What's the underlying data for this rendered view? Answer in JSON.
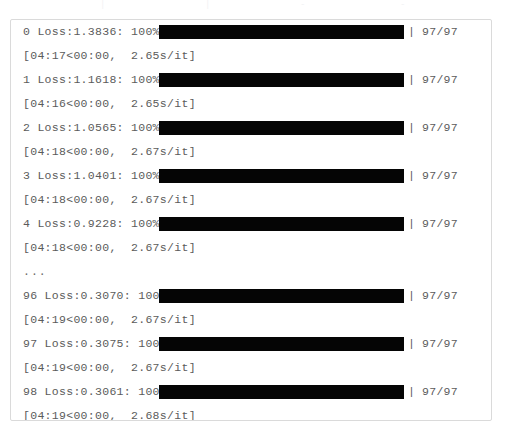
{
  "panel": {
    "border_color": "#dadada",
    "background_color": "#ffffff",
    "text_color": "#5b5b5b",
    "bar_color": "#050505"
  },
  "top_artifacts": [
    {
      "text": "|",
      "left": 100
    },
    {
      "text": "|",
      "left": 205
    },
    {
      "text": "-",
      "left": 300
    },
    {
      "text": "-",
      "left": 400
    }
  ],
  "log": {
    "rows": [
      {
        "kind": "progress",
        "epoch": "0",
        "loss_label": "Loss:",
        "loss": "1.3836",
        "percent": "100%",
        "prefix": "0 Loss:1.3836: 100%|",
        "bar_left": 148,
        "bar_right": 393,
        "close_bar": "|",
        "count": "97/97"
      },
      {
        "kind": "timing",
        "text": "[04:17<00:00,  2.65s/it]",
        "elapsed": "04:17",
        "remaining": "00:00",
        "rate": "2.65s/it"
      },
      {
        "kind": "progress",
        "epoch": "1",
        "loss_label": "Loss:",
        "loss": "1.1618",
        "percent": "100%",
        "prefix": "1 Loss:1.1618: 100%|",
        "bar_left": 148,
        "bar_right": 393,
        "close_bar": "|",
        "count": "97/97"
      },
      {
        "kind": "timing",
        "text": "[04:16<00:00,  2.65s/it]",
        "elapsed": "04:16",
        "remaining": "00:00",
        "rate": "2.65s/it"
      },
      {
        "kind": "progress",
        "epoch": "2",
        "loss_label": "Loss:",
        "loss": "1.0565",
        "percent": "100%",
        "prefix": "2 Loss:1.0565: 100%|",
        "bar_left": 148,
        "bar_right": 393,
        "close_bar": "|",
        "count": "97/97"
      },
      {
        "kind": "timing",
        "text": "[04:18<00:00,  2.67s/it]",
        "elapsed": "04:18",
        "remaining": "00:00",
        "rate": "2.67s/it"
      },
      {
        "kind": "progress",
        "epoch": "3",
        "loss_label": "Loss:",
        "loss": "1.0401",
        "percent": "100%",
        "prefix": "3 Loss:1.0401: 100%|",
        "bar_left": 148,
        "bar_right": 393,
        "close_bar": "|",
        "count": "97/97"
      },
      {
        "kind": "timing",
        "text": "[04:18<00:00,  2.67s/it]",
        "elapsed": "04:18",
        "remaining": "00:00",
        "rate": "2.67s/it"
      },
      {
        "kind": "progress",
        "epoch": "4",
        "loss_label": "Loss:",
        "loss": "0.9228",
        "percent": "100%",
        "prefix": "4 Loss:0.9228: 100%|",
        "bar_left": 148,
        "bar_right": 393,
        "close_bar": "|",
        "count": "97/97"
      },
      {
        "kind": "timing",
        "text": "[04:18<00:00,  2.67s/it]",
        "elapsed": "04:18",
        "remaining": "00:00",
        "rate": "2.67s/it"
      },
      {
        "kind": "ellipsis",
        "text": "..."
      },
      {
        "kind": "progress",
        "epoch": "96",
        "loss_label": "Loss:",
        "loss": "0.3070",
        "percent": "100%",
        "prefix": "96 Loss:0.3070: 100%|",
        "bar_left": 148,
        "bar_right": 393,
        "close_bar": "|",
        "count": "97/97"
      },
      {
        "kind": "timing",
        "text": "[04:19<00:00,  2.67s/it]",
        "elapsed": "04:19",
        "remaining": "00:00",
        "rate": "2.67s/it"
      },
      {
        "kind": "progress",
        "epoch": "97",
        "loss_label": "Loss:",
        "loss": "0.3075",
        "percent": "100%",
        "prefix": "97 Loss:0.3075: 100%|",
        "bar_left": 148,
        "bar_right": 393,
        "close_bar": "|",
        "count": "97/97"
      },
      {
        "kind": "timing",
        "text": "[04:19<00:00,  2.67s/it]",
        "elapsed": "04:19",
        "remaining": "00:00",
        "rate": "2.67s/it"
      },
      {
        "kind": "progress",
        "epoch": "98",
        "loss_label": "Loss:",
        "loss": "0.3061",
        "percent": "100%",
        "prefix": "98 Loss:0.3061: 100%|",
        "bar_left": 148,
        "bar_right": 393,
        "close_bar": "|",
        "count": "97/97"
      },
      {
        "kind": "timing",
        "text": "[04:19<00:00,  2.68s/it]",
        "elapsed": "04:19",
        "remaining": "00:00",
        "rate": "2.68s/it"
      },
      {
        "kind": "progress",
        "epoch": "99",
        "loss_label": "Loss:",
        "loss": "0.3014",
        "percent": "100%",
        "prefix": "99 Loss:0.3014: 100%|",
        "bar_left": 148,
        "bar_right": 393,
        "close_bar": "|",
        "count": "97/97"
      },
      {
        "kind": "timing",
        "text": "[04:19<00:00,  2.67s/it]",
        "elapsed": "04:19",
        "remaining": "00:00",
        "rate": "2.67s/it"
      },
      {
        "kind": "progress",
        "epoch": "100",
        "loss_label": "Loss:",
        "loss": "0.3010",
        "percent": "100%",
        "prefix": "100 Loss:0.3010: 100%|",
        "bar_left": 155,
        "bar_right": 400,
        "close_bar": "|",
        "count": "97/97"
      },
      {
        "kind": "timing",
        "text": "[04:19<00:00,  2.67s/it]",
        "elapsed": "04:19",
        "remaining": "00:00",
        "rate": "2.67s/it"
      }
    ]
  }
}
